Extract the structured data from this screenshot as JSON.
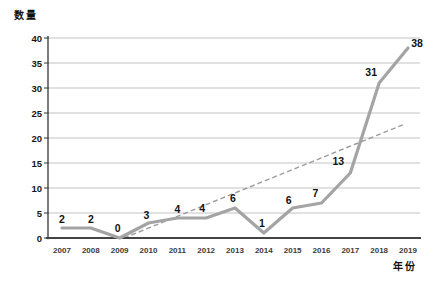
{
  "chart_data": {
    "type": "line",
    "title": "",
    "ylabel": "数量",
    "xlabel": "年份",
    "categories": [
      "2007",
      "2008",
      "2009",
      "2010",
      "2011",
      "2012",
      "2013",
      "2014",
      "2015",
      "2016",
      "2017",
      "2018",
      "2019"
    ],
    "series": [
      {
        "name": "数量",
        "values": [
          2,
          2,
          0,
          3,
          4,
          4,
          6,
          1,
          6,
          7,
          13,
          31,
          38
        ]
      }
    ],
    "data_labels_shown": true,
    "ylim": [
      0,
      40
    ],
    "ytick_step": 5,
    "ytick_labels": [
      "0",
      "5",
      "10",
      "15",
      "20",
      "25",
      "30",
      "35",
      "40"
    ],
    "grid": true,
    "legend": false,
    "trendline": {
      "style": "dashed",
      "from_index": 2.15,
      "from_value": 0,
      "to_index": 11.85,
      "to_value": 22.7
    },
    "colors": {
      "line": "#a4a4a4",
      "trend": "#9c9c9c",
      "grid": "#c3c3c3",
      "axis": "#444444",
      "text": "#121212"
    }
  }
}
